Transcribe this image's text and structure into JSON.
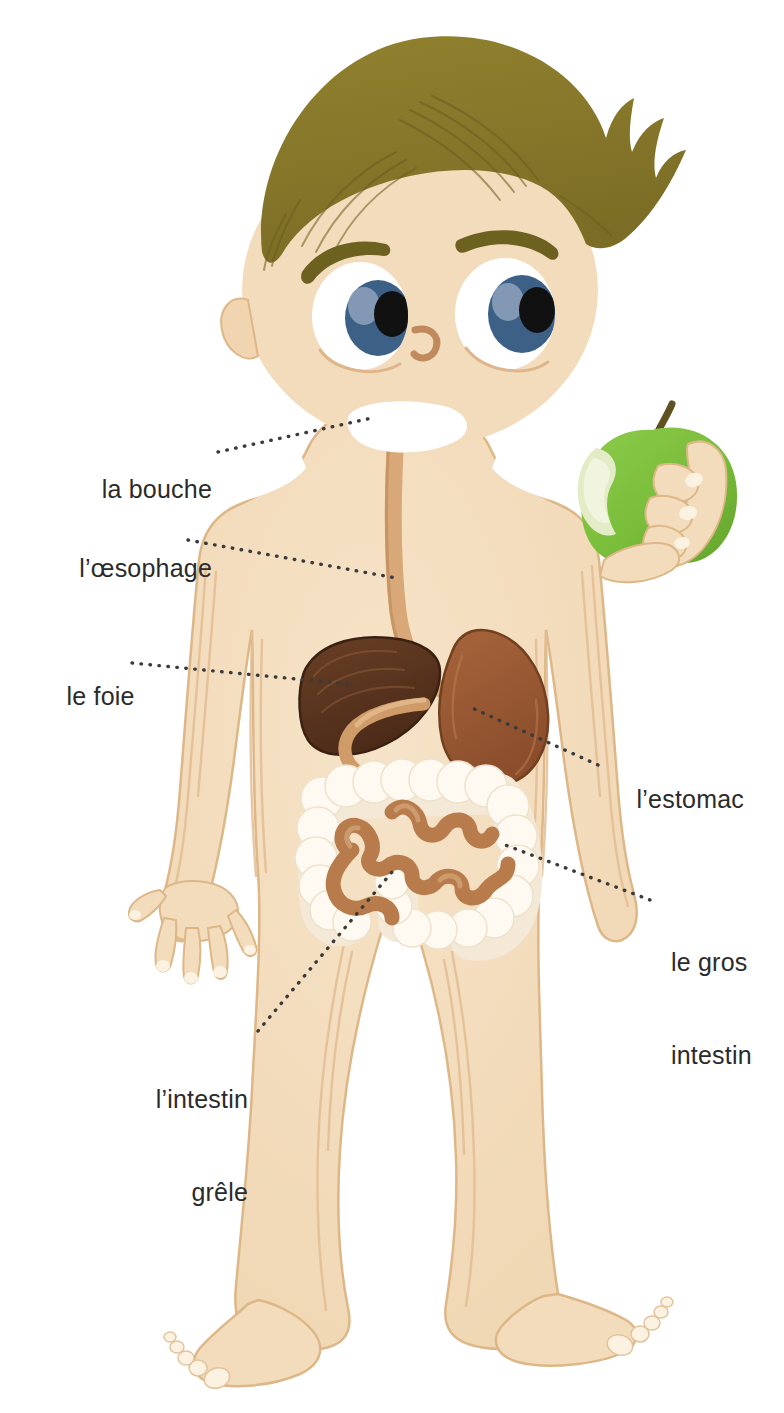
{
  "page": {
    "title_partial": "Le système digestif",
    "language": "fr",
    "background_color": "#ffffff"
  },
  "illustration": {
    "subject": "boy-digestive-system",
    "palette": {
      "skin": "#f3dcbc",
      "skin_shadow": "#e7c49a",
      "skin_outline": "#ddb787",
      "hair": "#8a7b2c",
      "hair_line": "#6d6120",
      "eye_white": "#ffffff",
      "iris": "#3d6186",
      "iris_light": "#8ea2bc",
      "pupil": "#111111",
      "eyebrow": "#6d6120",
      "nose": "#c08a5c",
      "mouth": "#ffffff",
      "apple_green": "#7cbf3f",
      "apple_green_dark": "#64a32f",
      "apple_flesh": "#dfe8c0",
      "apple_stem": "#5f5121",
      "liver": "#5c3620",
      "liver_dark": "#3f2313",
      "stomach": "#9d5c36",
      "stomach_dark": "#7d4526",
      "esophagus": "#d9a878",
      "esophagus_dark": "#b98353",
      "large_intestine": "#fdf8ee",
      "large_intestine_shade": "#efe2cd",
      "small_intestine": "#b87c4c",
      "small_intestine_light": "#cda077",
      "nail": "#fbf2e2",
      "leader_dot": "#3a3a3a",
      "label_text": "#2b2b2b"
    }
  },
  "labels": [
    {
      "id": "bouche",
      "text": "la bouche",
      "lines": [
        "la bouche"
      ],
      "align": "right",
      "x": 60,
      "y": 443,
      "width": 152,
      "organ": "mouth"
    },
    {
      "id": "oesophage",
      "text": "l’œsophage",
      "lines": [
        "l’œsophage"
      ],
      "align": "right",
      "x": 22,
      "y": 522,
      "width": 190,
      "organ": "esophagus"
    },
    {
      "id": "foie",
      "text": "le foie",
      "lines": [
        "le foie"
      ],
      "align": "right",
      "x": 38,
      "y": 650,
      "width": 85,
      "organ": "liver"
    },
    {
      "id": "estomac",
      "text": "l’estomac",
      "lines": [
        "l’estomac"
      ],
      "align": "left",
      "x": 608,
      "y": 753,
      "width": 150,
      "organ": "stomach"
    },
    {
      "id": "gros-intestin",
      "text": "le gros intestin",
      "lines": [
        "le gros",
        "intestin"
      ],
      "align": "left",
      "x": 671,
      "y": 885,
      "width": 110,
      "organ": "large-intestine"
    },
    {
      "id": "intestin-grele",
      "text": "l’intestin grêle",
      "lines": [
        "l’intestin",
        "grêle"
      ],
      "align": "right",
      "x": 120,
      "y": 1022,
      "width": 128,
      "organ": "small-intestine"
    }
  ],
  "leaders": [
    {
      "id": "leader-bouche",
      "from": [
        218,
        452
      ],
      "to": [
        372,
        418
      ]
    },
    {
      "id": "leader-oesophage",
      "from": [
        188,
        540
      ],
      "to": [
        396,
        578
      ]
    },
    {
      "id": "leader-foie",
      "from": [
        132,
        663
      ],
      "to": [
        348,
        684
      ]
    },
    {
      "id": "leader-estomac",
      "from": [
        598,
        765
      ],
      "to": [
        470,
        707
      ]
    },
    {
      "id": "leader-gros-intestin",
      "from": [
        650,
        900
      ],
      "to": [
        500,
        843
      ]
    },
    {
      "id": "leader-intestin-grele",
      "from": [
        258,
        1031
      ],
      "to": [
        392,
        872
      ]
    }
  ],
  "organs": [
    {
      "id": "mouth",
      "name": "la bouche",
      "color": "#ffffff"
    },
    {
      "id": "esophagus",
      "name": "l’œsophage",
      "color": "#d9a878"
    },
    {
      "id": "liver",
      "name": "le foie",
      "color": "#5c3620"
    },
    {
      "id": "stomach",
      "name": "l’estomac",
      "color": "#9d5c36"
    },
    {
      "id": "large-intestine",
      "name": "le gros intestin",
      "color": "#fdf8ee"
    },
    {
      "id": "small-intestine",
      "name": "l’intestin grêle",
      "color": "#b87c4c"
    }
  ],
  "props": [
    {
      "id": "apple",
      "name": "pomme croquée",
      "color": "#7cbf3f"
    }
  ]
}
